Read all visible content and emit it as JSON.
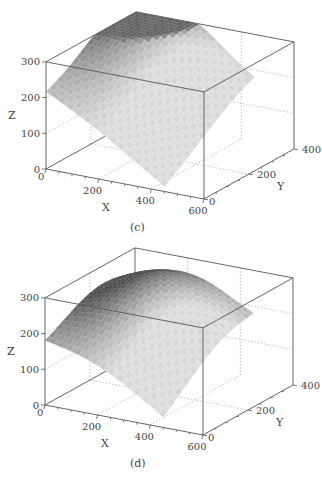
{
  "chart_data": [
    {
      "type": "surface3d",
      "panel_label": "(c)",
      "title": "",
      "xlabel": "X",
      "ylabel": "Y",
      "zlabel": "Z",
      "xlim": [
        0,
        600
      ],
      "ylim": [
        0,
        400
      ],
      "zlim": [
        0,
        300
      ],
      "x_ticks": [
        "0",
        "200",
        "400",
        "600"
      ],
      "y_ticks": [
        "0",
        "200",
        "400"
      ],
      "z_ticks": [
        "0",
        "100",
        "200",
        "300"
      ],
      "grid": true,
      "surface": {
        "x_range": [
          0,
          450
        ],
        "y_range": [
          0,
          400
        ],
        "z_corner_x0_y0": 205,
        "z_peak": 295,
        "peak_at": [
          150,
          330
        ],
        "z_corner_xmax_y0": 10,
        "z_corner_xmax_ymax": 150,
        "z_corner_x0_ymax": 250
      }
    },
    {
      "type": "surface3d",
      "panel_label": "(d)",
      "title": "",
      "xlabel": "X",
      "ylabel": "Y",
      "zlabel": "Z",
      "xlim": [
        0,
        600
      ],
      "ylim": [
        0,
        400
      ],
      "zlim": [
        0,
        300
      ],
      "x_ticks": [
        "0",
        "200",
        "400",
        "600"
      ],
      "y_ticks": [
        "0",
        "200",
        "400"
      ],
      "z_ticks": [
        "0",
        "100",
        "200",
        "300"
      ],
      "grid": true,
      "surface": {
        "x_range": [
          0,
          450
        ],
        "y_range": [
          0,
          400
        ],
        "z_corner_x0_y0": 155,
        "z_peak": 290,
        "peak_at": [
          200,
          250
        ],
        "z_corner_xmax_y0": 10,
        "z_corner_xmax_ymax": 140,
        "z_corner_x0_ymax": 170
      }
    }
  ]
}
